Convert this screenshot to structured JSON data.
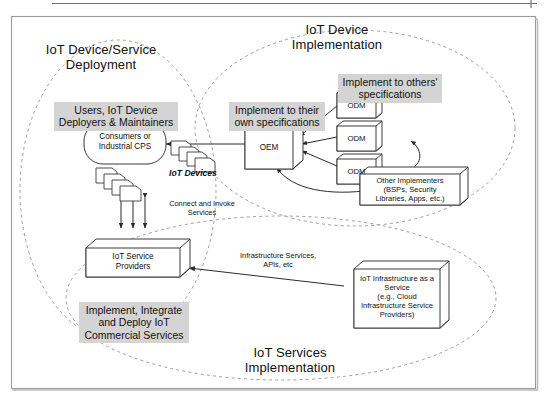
{
  "figure": {
    "background": "#ffffff",
    "frame_color": "#8a8a8a",
    "highlight_color": "#d4d4d4",
    "line_color": "#3a3a3a",
    "dashed_color": "#9a9a9a"
  },
  "zones": [
    {
      "id": "device-service-deployment",
      "label": "IoT Device/Service\nDeployment"
    },
    {
      "id": "iot-device-implementation",
      "label": "IoT Device\nImplementation"
    },
    {
      "id": "iot-services-implementation",
      "label": "IoT Services\nImplementation"
    }
  ],
  "highlights": [
    {
      "id": "users-deployers",
      "label": "Users, IoT Device\nDeployers & Maintainers"
    },
    {
      "id": "own-specifications",
      "label": "Implement to their\nown specifications"
    },
    {
      "id": "others-specifications",
      "label": "Implement to others'\nspecifications"
    },
    {
      "id": "commercial-services",
      "label": "Implement, Integrate\nand Deploy IoT\nCommercial Services"
    }
  ],
  "nodes": [
    {
      "id": "consumers-cps",
      "label": "Consumers or\nIndustrial CPS",
      "shape": "rounded"
    },
    {
      "id": "oem",
      "label": "OEM",
      "shape": "cube"
    },
    {
      "id": "odm-1",
      "label": "ODM",
      "shape": "cube"
    },
    {
      "id": "odm-2",
      "label": "ODM",
      "shape": "cube"
    },
    {
      "id": "odm-3",
      "label": "ODM",
      "shape": "cube"
    },
    {
      "id": "other-implementers",
      "label": "Other Implementers\n(BSPs, Security\nLibraries, Apps, etc.)",
      "shape": "cube"
    },
    {
      "id": "iot-service-providers",
      "label": "IoT Service\nProviders",
      "shape": "cube"
    },
    {
      "id": "iot-infrastructure-service",
      "label": "IoT Infrastructure as a\nService\n(e.g., Cloud\nInfrastructure Service\nProviders)",
      "shape": "cube"
    }
  ],
  "annotations": [
    {
      "id": "iot-devices",
      "label": "IoT Devices"
    },
    {
      "id": "connect-invoke",
      "label": "Connect and Invoke\nServices"
    },
    {
      "id": "infrastructure-services",
      "label": "Infrastructure Services,\nAPIs, etc"
    }
  ]
}
